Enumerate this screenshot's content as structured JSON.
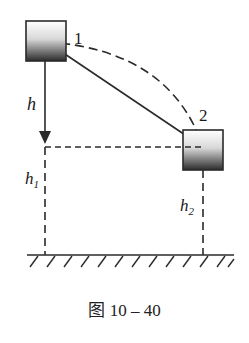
{
  "diagram": {
    "type": "physics-pendulum-energy",
    "positions": [
      {
        "label": "1",
        "description": "block at upper position"
      },
      {
        "label": "2",
        "description": "block at lower position after swing"
      }
    ],
    "heights": {
      "h": "h",
      "h1": "h",
      "h1_sub": "1",
      "h2": "h",
      "h2_sub": "2"
    },
    "colors": {
      "line": "#2a2a2a",
      "block_top": "#ffffff",
      "block_bottom": "#2b2b2b"
    }
  },
  "caption": "图 10 – 40"
}
